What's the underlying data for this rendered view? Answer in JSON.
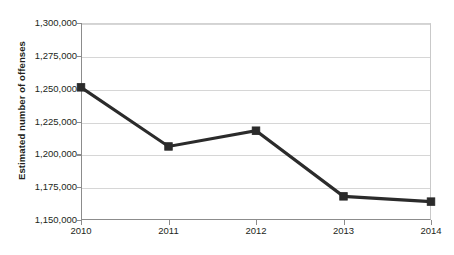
{
  "chart_data": {
    "type": "line",
    "title": "",
    "xlabel": "",
    "ylabel": "Estimated number of offenses",
    "categories": [
      "2010",
      "2011",
      "2012",
      "2013",
      "2014"
    ],
    "values": [
      1251000,
      1206000,
      1218000,
      1168000,
      1164000
    ],
    "series": [
      {
        "name": "Estimated number of offenses",
        "values": [
          1251000,
          1206000,
          1218000,
          1168000,
          1164000
        ]
      }
    ],
    "ylim": [
      1150000,
      1300000
    ],
    "ytick_step": 25000,
    "ytick_labels": [
      "1,300,000",
      "1,275,000",
      "1,250,000",
      "1,225,000",
      "1,200,000",
      "1,175,000",
      "1,150,000"
    ],
    "ytick_values": [
      1300000,
      1275000,
      1250000,
      1225000,
      1200000,
      1175000,
      1150000
    ],
    "xtick_labels": [
      "2010",
      "2011",
      "2012",
      "2013",
      "2014"
    ],
    "grid": true,
    "legend": "none",
    "marker": "square",
    "colors": {
      "line": "#2b2b2b",
      "marker": "#2b2b2b",
      "grid": "#d6d6d6",
      "axis": "#8c8c8c",
      "background": "#ffffff",
      "text": "#231f20"
    }
  },
  "axis_title": {
    "y": "Estimated number of offenses"
  },
  "header": {
    "title_partial": ""
  }
}
